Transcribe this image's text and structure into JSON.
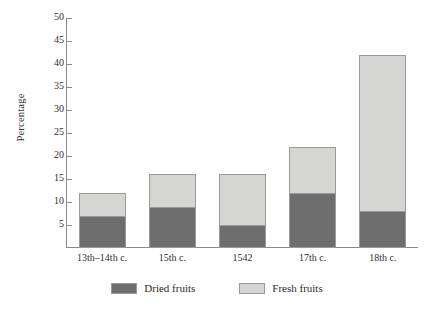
{
  "chart_data": {
    "type": "bar",
    "stacked": true,
    "title": "",
    "xlabel": "",
    "ylabel": "Percentage",
    "ylim": [
      0,
      50
    ],
    "ytick_step": 5,
    "yticks": [
      5,
      10,
      15,
      20,
      25,
      30,
      35,
      40,
      45,
      50
    ],
    "grid": false,
    "legend_position": "bottom-center",
    "categories": [
      "13th–14th c.",
      "15th c.",
      "1542",
      "17th c.",
      "18th c."
    ],
    "series": [
      {
        "name": "Dried fruits",
        "color": "#6e6e6e",
        "values": [
          7,
          9,
          5,
          12,
          8
        ]
      },
      {
        "name": "Fresh fruits",
        "color": "#d5d5d3",
        "values": [
          5,
          7,
          11,
          10,
          34
        ]
      }
    ],
    "totals": [
      12,
      16,
      16,
      22,
      42
    ]
  },
  "legend": {
    "items": [
      {
        "label": "Dried fruits",
        "swatch": "dried-fruits-swatch"
      },
      {
        "label": "Fresh fruits",
        "swatch": "fresh-fruits-swatch"
      }
    ]
  },
  "caption": {
    "sliver_text": ""
  }
}
